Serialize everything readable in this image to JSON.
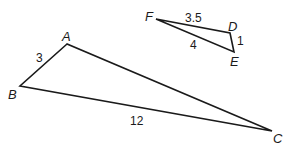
{
  "diagram": {
    "type": "similar-triangles",
    "stroke_color": "#1a1a1a",
    "triangles": [
      {
        "name": "ABC",
        "vertices": {
          "A": {
            "label": "A",
            "x": 67,
            "y": 44
          },
          "B": {
            "label": "B",
            "x": 20,
            "y": 86
          },
          "C": {
            "label": "C",
            "x": 272,
            "y": 131
          }
        },
        "sides": {
          "AB": {
            "label": "3"
          },
          "BC": {
            "label": "12"
          },
          "AC": {
            "label": ""
          }
        }
      },
      {
        "name": "DEF",
        "vertices": {
          "D": {
            "label": "D",
            "x": 230,
            "y": 33
          },
          "E": {
            "label": "E",
            "x": 234,
            "y": 52
          },
          "F": {
            "label": "F",
            "x": 156,
            "y": 19
          }
        },
        "sides": {
          "FD": {
            "label": "3.5"
          },
          "DE": {
            "label": "1"
          },
          "FE": {
            "label": "4"
          }
        }
      }
    ]
  }
}
